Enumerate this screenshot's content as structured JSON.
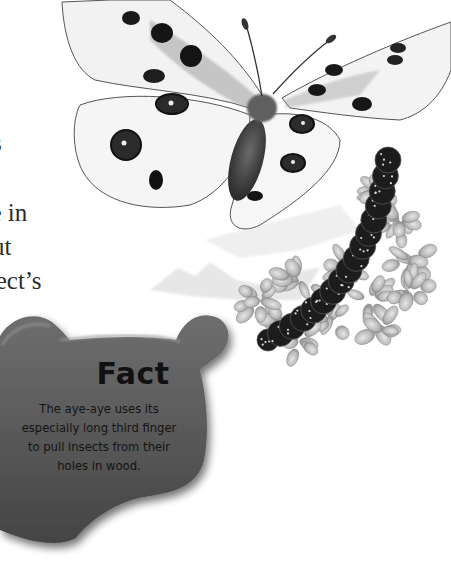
{
  "page": {
    "body_text_fragments": [
      "s",
      "",
      "ne in",
      "ut",
      "sect’s"
    ]
  },
  "illustrations": {
    "butterfly": "apollo-butterfly-illustration",
    "caterpillar": "caterpillar-on-plant-illustration",
    "landscape": "distant-mountains-sketch"
  },
  "fact_box": {
    "title": "Fact",
    "lines": [
      "The aye-aye uses its",
      "especially long third finger",
      "to pull insects from their",
      "holes in wood."
    ],
    "color": "#5a5a5a"
  }
}
